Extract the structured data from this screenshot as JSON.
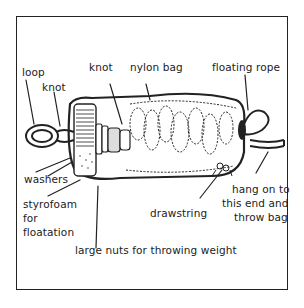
{
  "diagram": {
    "type": "labeled illustration",
    "labels": {
      "loop": "loop",
      "knot_left": "knot",
      "knot_center": "knot",
      "nylon_bag": "nylon bag",
      "floating_rope": "floating rope",
      "washers": "washers",
      "styrofoam_line1": "styrofoam",
      "styrofoam_line2": "for",
      "styrofoam_line3": "floatation",
      "drawstring": "drawstring",
      "hang_line1": "hang on to",
      "hang_line2": "this end and",
      "hang_line3": "throw bag",
      "nuts": "large nuts for throwing weight"
    },
    "colors": {
      "ink": "#222222",
      "background": "#ffffff"
    }
  }
}
